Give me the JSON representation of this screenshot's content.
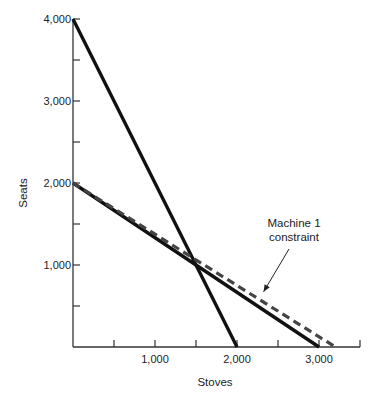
{
  "chart_data": {
    "type": "line",
    "title": "",
    "xlabel": "Stoves",
    "ylabel": "Seats",
    "xlim": [
      0,
      3500
    ],
    "ylim": [
      0,
      4000
    ],
    "grid": false,
    "x_ticks": [
      500,
      1000,
      1500,
      2000,
      2500,
      3000,
      3500
    ],
    "x_tick_labels": [
      {
        "value": 1000,
        "label": "1,000"
      },
      {
        "value": 2000,
        "label": "2,000"
      },
      {
        "value": 3000,
        "label": "3,000"
      }
    ],
    "y_ticks": [
      500,
      1000,
      1500,
      2000,
      2500,
      3000,
      3500,
      4000
    ],
    "y_tick_labels": [
      {
        "value": 1000,
        "label": "1,000"
      },
      {
        "value": 2000,
        "label": "2,000"
      },
      {
        "value": 3000,
        "label": "3,000"
      },
      {
        "value": 4000,
        "label": "4,000"
      }
    ],
    "series": [
      {
        "name": "constraint-steep",
        "style": "solid",
        "points": [
          [
            0,
            4000
          ],
          [
            2000,
            0
          ]
        ]
      },
      {
        "name": "constraint-shallow",
        "style": "solid",
        "points": [
          [
            0,
            2000
          ],
          [
            3000,
            0
          ]
        ]
      },
      {
        "name": "Machine 1 constraint",
        "style": "dashed",
        "points": [
          [
            0,
            2000
          ],
          [
            3200,
            0
          ]
        ]
      }
    ],
    "annotations": [
      {
        "lines": [
          "Machine 1",
          "constraint"
        ],
        "points_to": [
          2300,
          600
        ]
      }
    ]
  }
}
